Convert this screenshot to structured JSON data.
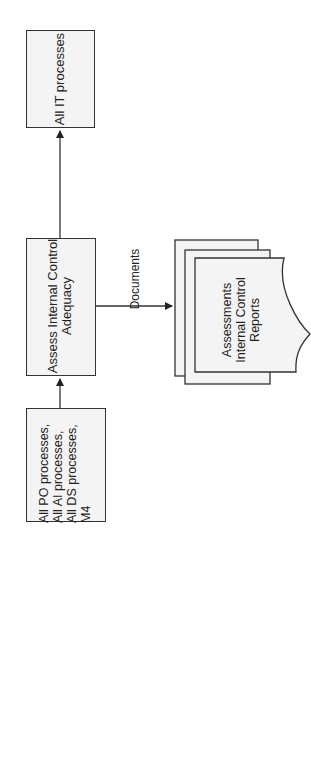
{
  "diagram": {
    "orientation": "rotated -90deg (text reads bottom-to-top)",
    "nodes": {
      "input": {
        "label": "All PO processes,\nAll AI processes,\nAll DS processes,\nM4"
      },
      "process": {
        "label": "Assess Internal Control\nAdequacy"
      },
      "output": {
        "label": "All IT processes"
      },
      "documents": {
        "label": "Assessments\nInternal Control\nReports"
      }
    },
    "edges": [
      {
        "from": "input",
        "to": "process",
        "label": ""
      },
      {
        "from": "process",
        "to": "output",
        "label": ""
      },
      {
        "from": "process",
        "to": "documents",
        "label": "Documents"
      }
    ],
    "edge_labels": {
      "documents": "Documents"
    },
    "colors": {
      "stroke": "#333333",
      "fill": "#f4f4f4",
      "text": "#222222"
    }
  }
}
